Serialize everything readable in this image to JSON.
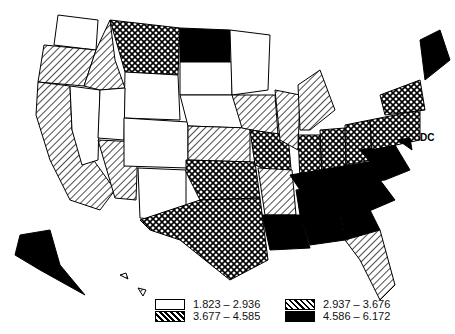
{
  "map": {
    "region": "United States",
    "classes": [
      {
        "range": "1.823 – 2.936",
        "pattern": "white"
      },
      {
        "range": "2.937 – 3.676",
        "pattern": "hatch"
      },
      {
        "range": "3.677 – 4.585",
        "pattern": "crosshatch"
      },
      {
        "range": "4.586 – 6.172",
        "pattern": "black"
      }
    ]
  },
  "labels": {
    "dc": "DC"
  }
}
